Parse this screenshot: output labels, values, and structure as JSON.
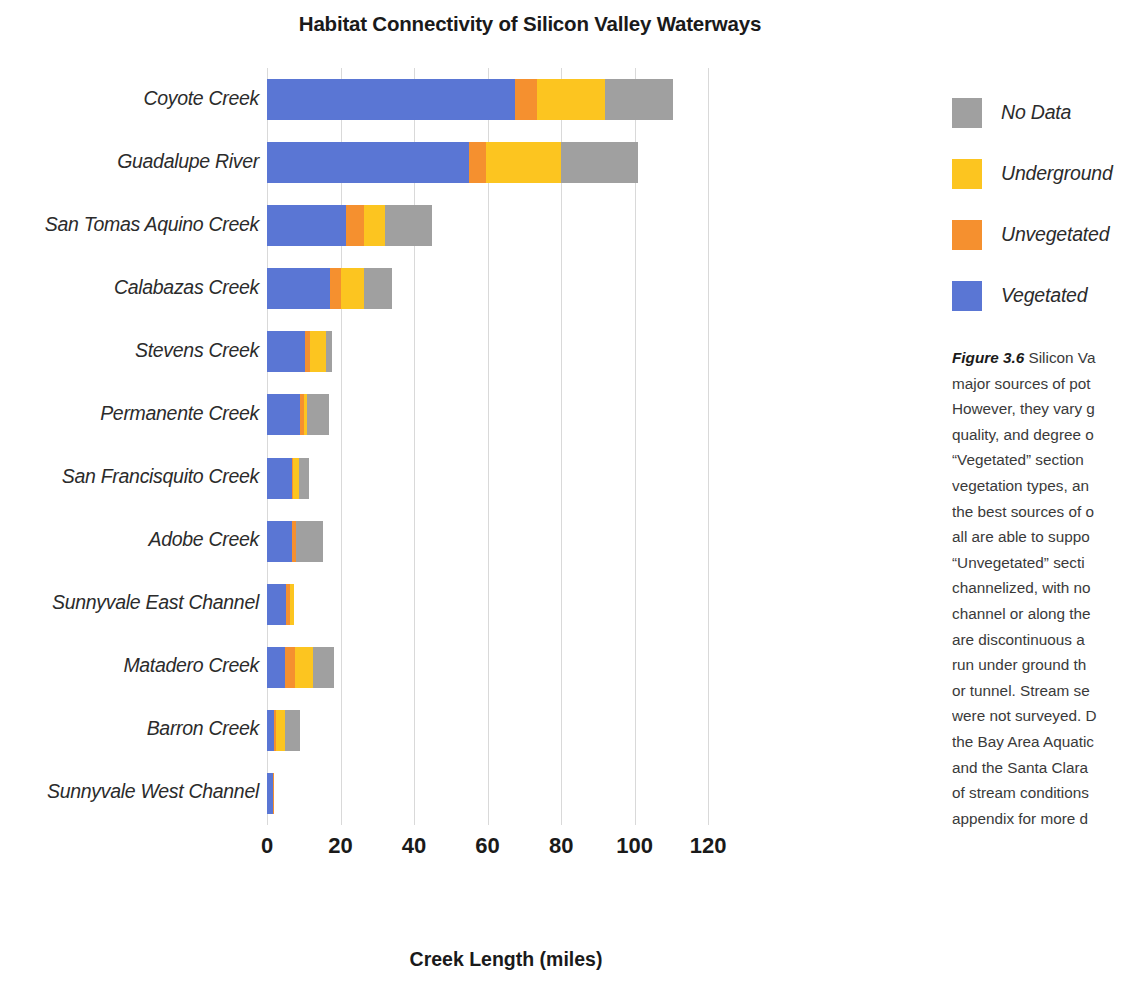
{
  "chart_data": {
    "type": "bar",
    "orientation": "horizontal",
    "stacked": true,
    "title": "Habitat Connectivity of Silicon Valley Waterways",
    "xlabel": "Creek Length (miles)",
    "ylabel": "",
    "xlim": [
      0,
      130
    ],
    "xticks": [
      0,
      20,
      40,
      60,
      80,
      100,
      120
    ],
    "grid": "vertical",
    "legend_position": "right",
    "categories": [
      "Coyote Creek",
      "Guadalupe River",
      "San Tomas Aquino Creek",
      "Calabazas Creek",
      "Stevens Creek",
      "Permanente Creek",
      "San Francisquito Creek",
      "Adobe Creek",
      "Sunnyvale East Channel",
      "Matadero Creek",
      "Barron Creek",
      "Sunnyvale West Channel"
    ],
    "series": [
      {
        "name": "Vegetated",
        "color": "#5A76D4",
        "values": [
          67.5,
          55.0,
          21.5,
          17.0,
          10.3,
          9.0,
          6.8,
          6.8,
          5.3,
          5.0,
          2.0,
          1.5
        ]
      },
      {
        "name": "Unvegetated",
        "color": "#F5902F",
        "values": [
          6.0,
          4.5,
          5.0,
          3.0,
          1.3,
          1.0,
          0.4,
          1.0,
          0.9,
          2.5,
          0.4,
          0.4
        ]
      },
      {
        "name": "Underground",
        "color": "#FCC520",
        "values": [
          18.5,
          20.5,
          5.5,
          6.5,
          4.5,
          0.8,
          1.6,
          0.0,
          1.2,
          5.0,
          2.5,
          0.0
        ]
      },
      {
        "name": "No Data",
        "color": "#A0A0A0",
        "values": [
          18.5,
          21.0,
          13.0,
          7.5,
          1.5,
          6.2,
          2.5,
          7.3,
          0.0,
          5.8,
          4.0,
          0.0
        ]
      }
    ],
    "totals": [
      110.5,
      101.0,
      45.0,
      34.0,
      17.6,
      17.0,
      11.3,
      15.1,
      7.4,
      18.3,
      8.9,
      1.9
    ]
  },
  "legend": {
    "items": [
      {
        "label": "No Data",
        "color": "#A0A0A0"
      },
      {
        "label": "Underground",
        "color": "#FCC520"
      },
      {
        "label": "Unvegetated",
        "color": "#F5902F"
      },
      {
        "label": "Vegetated",
        "color": "#5A76D4"
      }
    ]
  },
  "caption": {
    "figure_number": "Figure 3.6",
    "lines": [
      "Silicon Va",
      "major sources of pot",
      "However, they vary g",
      "quality, and degree o",
      "“Vegetated” section",
      "vegetation types, an",
      "the best sources of o",
      "all are able to suppo",
      "“Unvegetated” secti",
      "channelized, with no",
      "channel or along the",
      "are discontinuous a",
      "run under ground th",
      "or tunnel. Stream se",
      "were not surveyed. D",
      "the Bay Area Aquatic",
      "and the Santa Clara",
      "of stream conditions",
      "appendix for more d"
    ]
  }
}
